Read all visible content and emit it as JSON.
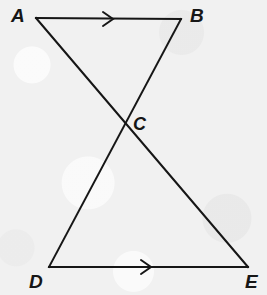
{
  "figure": {
    "type": "geometry-diagram",
    "width": 267,
    "height": 295,
    "background_color": "#f1f1f1",
    "stroke_color": "#161616",
    "stroke_width": 2
  },
  "points": {
    "A": {
      "label": "A",
      "x": 36,
      "y": 18
    },
    "B": {
      "label": "B",
      "x": 181,
      "y": 19
    },
    "C": {
      "label": "C",
      "x": 125,
      "y": 123
    },
    "D": {
      "label": "D",
      "x": 49,
      "y": 267
    },
    "E": {
      "label": "E",
      "x": 248,
      "y": 267
    }
  },
  "segments": [
    {
      "name": "AB",
      "from": "A",
      "to": "B",
      "tick": "single-arrow"
    },
    {
      "name": "DE",
      "from": "D",
      "to": "E",
      "tick": "single-arrow"
    },
    {
      "name": "AE",
      "from": "A",
      "to": "E",
      "tick": "none"
    },
    {
      "name": "BD",
      "from": "B",
      "to": "D",
      "tick": "none"
    }
  ],
  "arrow_marks": [
    {
      "name": "ab-parallel-arrow",
      "on": "AB",
      "x": 110,
      "y": 19,
      "direction": "right"
    },
    {
      "name": "de-parallel-arrow",
      "on": "DE",
      "x": 148,
      "y": 267,
      "direction": "right"
    }
  ]
}
